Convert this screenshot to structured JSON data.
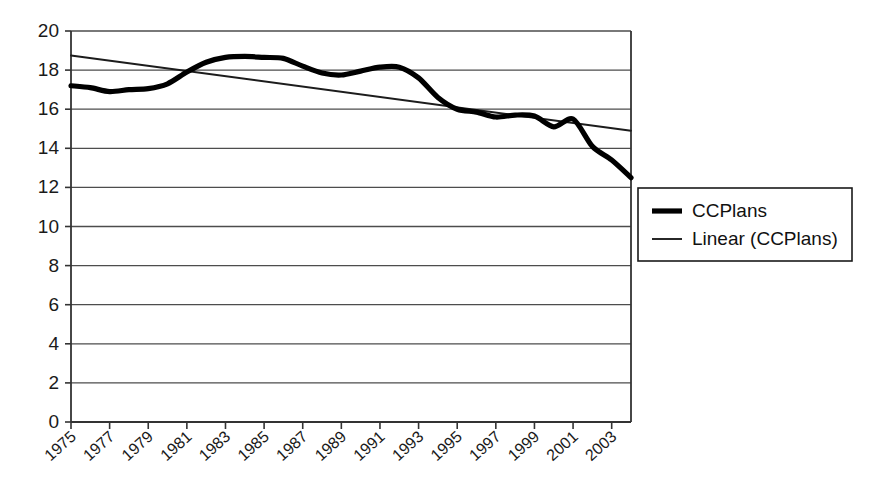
{
  "chart_data": {
    "type": "line",
    "title": "",
    "subtitle": "",
    "xlabel": "",
    "ylabel": "",
    "xlim": [
      1975,
      2004
    ],
    "ylim": [
      0,
      20
    ],
    "grid": true,
    "legend_position": "right",
    "y_ticks": [
      20,
      18,
      16,
      14,
      12,
      10,
      8,
      6,
      4,
      2,
      0
    ],
    "y_tick_labels": [
      "20",
      "18",
      "16",
      "14",
      "12",
      "10",
      "8",
      "6",
      "4",
      "2",
      "0"
    ],
    "x_ticks": [
      1975,
      1977,
      1979,
      1981,
      1983,
      1985,
      1987,
      1989,
      1991,
      1993,
      1995,
      1997,
      1999,
      2001,
      2003
    ],
    "x_tick_labels": [
      "1975",
      "1977",
      "1979",
      "1981",
      "1983",
      "1985",
      "1987",
      "1989",
      "1991",
      "1993",
      "1995",
      "1997",
      "1999",
      "2001",
      "2003"
    ],
    "x": [
      1975,
      1976,
      1977,
      1978,
      1979,
      1980,
      1981,
      1982,
      1983,
      1984,
      1985,
      1986,
      1987,
      1988,
      1989,
      1990,
      1991,
      1992,
      1993,
      1994,
      1995,
      1996,
      1997,
      1998,
      1999,
      2000,
      2001,
      2002,
      2003,
      2004
    ],
    "series": [
      {
        "name": "CCPlans",
        "style": "thick-solid",
        "color": "#000000",
        "values": [
          17.2,
          17.1,
          16.9,
          17.0,
          17.05,
          17.3,
          17.9,
          18.4,
          18.65,
          18.7,
          18.65,
          18.6,
          18.2,
          17.85,
          17.75,
          17.95,
          18.15,
          18.15,
          17.6,
          16.6,
          16.0,
          15.85,
          15.6,
          15.7,
          15.65,
          15.1,
          15.5,
          14.1,
          13.4,
          12.5
        ]
      },
      {
        "name": "Linear (CCPlans)",
        "style": "thin-solid",
        "color": "#1c1c1c",
        "trend": true,
        "endpoints": [
          [
            1975,
            18.75
          ],
          [
            2004,
            14.9
          ]
        ],
        "values": [
          18.75,
          18.62,
          18.49,
          18.36,
          18.22,
          18.09,
          17.96,
          17.83,
          17.69,
          17.56,
          17.43,
          17.3,
          17.16,
          17.03,
          16.9,
          16.77,
          16.63,
          16.5,
          16.37,
          16.24,
          16.1,
          15.97,
          15.84,
          15.71,
          15.57,
          15.44,
          15.31,
          15.18,
          15.04,
          14.9
        ]
      }
    ]
  },
  "legend": {
    "entries": [
      {
        "label": "CCPlans",
        "swatch": "thick-line-swatch"
      },
      {
        "label": "Linear (CCPlans)",
        "swatch": "thin-line-swatch"
      }
    ]
  }
}
